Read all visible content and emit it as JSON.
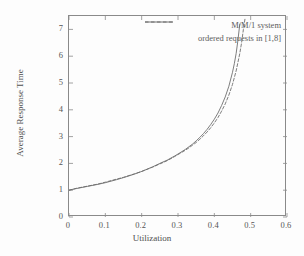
{
  "chart_data": {
    "type": "line",
    "title": "",
    "xlabel": "Utilization",
    "ylabel": "Average Response Time",
    "xlim": [
      0,
      0.6
    ],
    "ylim": [
      0,
      7.5
    ],
    "xticks": [
      "0",
      "0.1",
      "0.2",
      "0.3",
      "0.4",
      "0.5",
      "0.6"
    ],
    "xtick_values": [
      0,
      0.1,
      0.2,
      0.3,
      0.4,
      0.5,
      0.6
    ],
    "yticks": [
      "0",
      "1",
      "2",
      "3",
      "4",
      "5",
      "6",
      "7"
    ],
    "ytick_values": [
      0,
      1,
      2,
      3,
      4,
      5,
      6,
      7
    ],
    "grid": false,
    "legend_position": "top-right-inside",
    "series": [
      {
        "name": "M/M/1 system",
        "style": "solid",
        "color": "#6e6e6e",
        "x": [
          0,
          0.02,
          0.05,
          0.08,
          0.1,
          0.13,
          0.15,
          0.18,
          0.2,
          0.23,
          0.25,
          0.27,
          0.29,
          0.3,
          0.32,
          0.33,
          0.34,
          0.35,
          0.36,
          0.37,
          0.38,
          0.39,
          0.4,
          0.41,
          0.42,
          0.43,
          0.44,
          0.45,
          0.455,
          0.46,
          0.465,
          0.47
        ],
        "y": [
          1.0,
          1.06,
          1.14,
          1.22,
          1.28,
          1.39,
          1.47,
          1.6,
          1.7,
          1.87,
          2.0,
          2.12,
          2.27,
          2.35,
          2.52,
          2.62,
          2.72,
          2.84,
          2.97,
          3.11,
          3.27,
          3.45,
          3.65,
          3.88,
          4.16,
          4.48,
          4.88,
          5.4,
          5.72,
          6.1,
          6.6,
          7.2
        ]
      },
      {
        "name": "ordered requests in [1,8]",
        "style": "dashed",
        "color": "#6e6e6e",
        "x": [
          0,
          0.02,
          0.05,
          0.08,
          0.1,
          0.13,
          0.15,
          0.18,
          0.2,
          0.23,
          0.25,
          0.27,
          0.29,
          0.3,
          0.32,
          0.33,
          0.34,
          0.35,
          0.36,
          0.37,
          0.38,
          0.39,
          0.4,
          0.41,
          0.42,
          0.43,
          0.44,
          0.45,
          0.46,
          0.47,
          0.475,
          0.48,
          0.485
        ],
        "y": [
          1.0,
          1.07,
          1.15,
          1.23,
          1.3,
          1.41,
          1.48,
          1.61,
          1.7,
          1.86,
          1.98,
          2.1,
          2.25,
          2.33,
          2.49,
          2.58,
          2.68,
          2.78,
          2.9,
          3.03,
          3.17,
          3.33,
          3.51,
          3.71,
          3.95,
          4.22,
          4.55,
          4.95,
          5.45,
          6.1,
          6.5,
          7.0,
          7.45
        ]
      }
    ]
  },
  "axes": {
    "xlabel": "Utilization",
    "ylabel": "Average Response Time"
  },
  "legend": {
    "entries": [
      {
        "label": "M/M/1 system",
        "style": "solid"
      },
      {
        "label": "ordered requests in [1,8]",
        "style": "dashed"
      }
    ]
  },
  "colors": {
    "ink": "#6e6e6e",
    "axis": "#8a8a8a",
    "background": "#fdfdfd"
  }
}
